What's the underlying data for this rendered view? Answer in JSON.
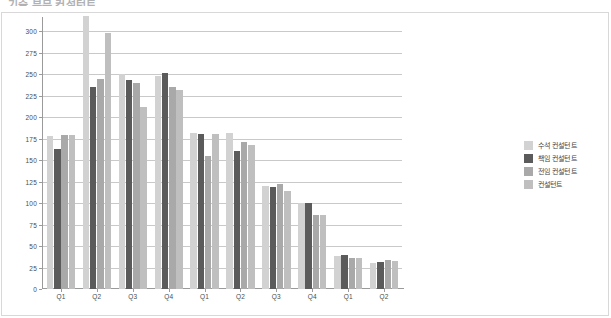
{
  "chart_data": {
    "type": "bar",
    "title": "기술 부문 컨설턴트",
    "xlabel": "",
    "ylabel": "",
    "ylim": [
      0,
      300
    ],
    "yticks": [
      0,
      25,
      50,
      75,
      100,
      125,
      150,
      175,
      200,
      225,
      250,
      275,
      300
    ],
    "grid": true,
    "legend_position": "right",
    "categories": [
      "Q1",
      "Q2",
      "Q3",
      "Q4",
      "Q1",
      "Q2",
      "Q3",
      "Q4",
      "Q1",
      "Q2"
    ],
    "series": [
      {
        "name": "수석 컨설턴트",
        "color": "#d2d2d2",
        "values": [
          178,
          318,
          250,
          248,
          181,
          181,
          120,
          100,
          38,
          30
        ]
      },
      {
        "name": "책임 컨설턴트",
        "color": "#5b5b5b",
        "values": [
          163,
          235,
          243,
          251,
          180,
          160,
          119,
          100,
          39,
          31
        ]
      },
      {
        "name": "전임 컨설턴트",
        "color": "#a9a9a9",
        "values": [
          179,
          244,
          240,
          235,
          155,
          171,
          122,
          86,
          36,
          34
        ]
      },
      {
        "name": "컨설턴트",
        "color": "#bfbfbf",
        "values": [
          179,
          298,
          212,
          231,
          180,
          167,
          114,
          86,
          36,
          33
        ]
      }
    ]
  },
  "legend": {
    "items": [
      {
        "label": "수석 컨설턴트",
        "color": "#d2d2d2"
      },
      {
        "label": "책임 컨설턴트",
        "color": "#5b5b5b"
      },
      {
        "label": "전임 컨설턴트",
        "color": "#a9a9a9"
      },
      {
        "label": "컨설턴트",
        "color": "#bfbfbf"
      }
    ]
  }
}
